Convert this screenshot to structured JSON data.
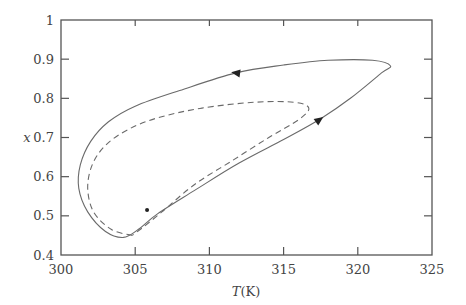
{
  "chart_data": {
    "type": "line",
    "title": "",
    "xlabel": "T(K)",
    "xlabel_var": "T",
    "xlabel_unit": "(K)",
    "ylabel": "x",
    "xlim": [
      300,
      325
    ],
    "ylim": [
      0.4,
      1.0
    ],
    "xticks": [
      "300",
      "305",
      "310",
      "315",
      "320",
      "325"
    ],
    "yticks": [
      "0.4",
      "0.5",
      "0.6",
      "0.7",
      "0.8",
      "0.9",
      "1"
    ],
    "grid": false,
    "legend": null,
    "series": [
      {
        "name": "limit-cycle-solid",
        "style": "solid",
        "closed": true,
        "direction": "clockwise (right along lower branch, left along upper branch)",
        "points_T_x": [
          [
            304.2,
            0.445
          ],
          [
            303.0,
            0.46
          ],
          [
            301.8,
            0.51
          ],
          [
            301.2,
            0.57
          ],
          [
            301.3,
            0.63
          ],
          [
            302.0,
            0.69
          ],
          [
            303.2,
            0.74
          ],
          [
            305.0,
            0.78
          ],
          [
            308.0,
            0.82
          ],
          [
            311.8,
            0.865
          ],
          [
            315.0,
            0.885
          ],
          [
            318.0,
            0.897
          ],
          [
            321.0,
            0.897
          ],
          [
            322.2,
            0.883
          ],
          [
            321.6,
            0.865
          ],
          [
            319.5,
            0.8
          ],
          [
            317.5,
            0.748
          ],
          [
            315.0,
            0.695
          ],
          [
            312.0,
            0.635
          ],
          [
            309.0,
            0.565
          ],
          [
            306.5,
            0.505
          ],
          [
            305.2,
            0.465
          ],
          [
            304.2,
            0.445
          ]
        ],
        "arrows": [
          {
            "T": 311.8,
            "x": 0.865,
            "direction": "left"
          },
          {
            "T": 317.4,
            "x": 0.745,
            "direction": "up-right"
          }
        ]
      },
      {
        "name": "trajectory-dashed",
        "style": "dashed",
        "closed": false,
        "points_T_x": [
          [
            304.8,
            0.45
          ],
          [
            303.4,
            0.465
          ],
          [
            302.2,
            0.51
          ],
          [
            301.8,
            0.57
          ],
          [
            302.1,
            0.63
          ],
          [
            303.0,
            0.68
          ],
          [
            304.5,
            0.72
          ],
          [
            306.5,
            0.75
          ],
          [
            309.5,
            0.775
          ],
          [
            313.0,
            0.79
          ],
          [
            315.7,
            0.79
          ],
          [
            316.7,
            0.775
          ],
          [
            316.0,
            0.745
          ],
          [
            314.0,
            0.7
          ],
          [
            311.5,
            0.64
          ],
          [
            309.0,
            0.58
          ],
          [
            306.8,
            0.51
          ],
          [
            305.5,
            0.47
          ],
          [
            304.8,
            0.45
          ]
        ]
      }
    ],
    "annotations": [
      {
        "type": "point",
        "T": 305.8,
        "x": 0.515,
        "label": "fixed-point"
      }
    ]
  }
}
